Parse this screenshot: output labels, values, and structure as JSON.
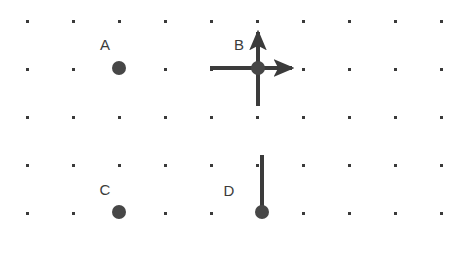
{
  "figure": {
    "title": "",
    "background_color": "#ffffff",
    "width": 462,
    "height": 258
  },
  "grid": {
    "dot_color": "#3a3a3a",
    "dot_size": 3,
    "origin_x": 27,
    "origin_y": 21,
    "spacing_x": 46,
    "spacing_y": 48,
    "columns": 10,
    "rows": 5
  },
  "style": {
    "marker_color": "#474747",
    "marker_radius": 7,
    "vector_color": "#3b3b3b",
    "vector_width": 4,
    "label_color": "#3b3b3b",
    "label_font_size": 15
  },
  "chart_data": {
    "type": "diagram",
    "points": [
      {
        "label": "A",
        "x": 119,
        "y": 68,
        "label_x": 105,
        "label_y": 46,
        "vectors": []
      },
      {
        "label": "B",
        "x": 258,
        "y": 68,
        "label_x": 239,
        "label_y": 46,
        "vectors": [
          {
            "name": "up",
            "dx": 0,
            "dy": -36,
            "arrowhead": true
          },
          {
            "name": "right",
            "dx": 34,
            "dy": 0,
            "arrowhead": true
          },
          {
            "name": "left",
            "dx": -48,
            "dy": 0,
            "arrowhead": false
          },
          {
            "name": "down",
            "dx": 0,
            "dy": 38,
            "arrowhead": false
          }
        ]
      },
      {
        "label": "C",
        "x": 119,
        "y": 212,
        "label_x": 105,
        "label_y": 191,
        "vectors": []
      },
      {
        "label": "D",
        "x": 262,
        "y": 212,
        "label_x": 229,
        "label_y": 192,
        "vectors": [
          {
            "name": "up",
            "dx": 0,
            "dy": -57,
            "arrowhead": false
          }
        ]
      }
    ]
  }
}
